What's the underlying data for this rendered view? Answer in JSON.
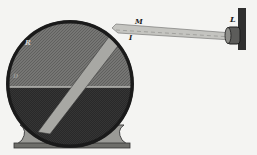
{
  "figure": {
    "labels": {
      "source": "L",
      "entry_top": "M",
      "entry_point": "I",
      "rim": "R",
      "left": "D"
    },
    "colors": {
      "background": "#f4f4f2",
      "tank_dark": "#2e2e2e",
      "tank_upper": "#6a6a68",
      "water": "#343434",
      "beam": "#bdbdb8",
      "base": "#8c8c88"
    }
  }
}
